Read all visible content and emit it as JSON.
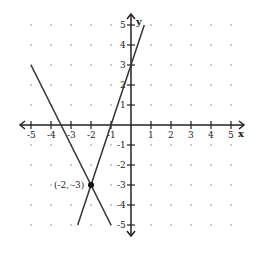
{
  "chart_data": {
    "type": "line",
    "title": "",
    "xlabel": "x",
    "ylabel": "y",
    "xlim": [
      -5,
      5
    ],
    "ylim": [
      -5,
      5
    ],
    "grid": "dotted points at integer coordinates",
    "x_ticks": [
      "-5",
      "-4",
      "-3",
      "-2",
      "-1",
      "1",
      "2",
      "3",
      "4",
      "5"
    ],
    "y_ticks": [
      "5",
      "4",
      "3",
      "2",
      "1",
      "-1",
      "-2",
      "-3",
      "-4",
      "-5"
    ],
    "series": [
      {
        "name": "line-1",
        "equation": "y = 3x + 3",
        "points": [
          [
            -2.667,
            -5
          ],
          [
            0.667,
            5
          ]
        ]
      },
      {
        "name": "line-2",
        "equation": "y = -2x - 7",
        "points": [
          [
            -5,
            3
          ],
          [
            -1,
            -5
          ]
        ]
      }
    ],
    "annotations": [
      {
        "label": "(-2, -3)",
        "point": [
          -2,
          -3
        ],
        "marker": "filled-dot"
      }
    ]
  },
  "labels": {
    "x_axis": "x",
    "y_axis": "y",
    "point": "(-2, -3)",
    "xt": {
      "m5": "-5",
      "m4": "-4",
      "m3": "-3",
      "m2": "-2",
      "m1": "-1",
      "p1": "1",
      "p2": "2",
      "p3": "3",
      "p4": "4",
      "p5": "5"
    },
    "yt": {
      "p5": "5",
      "p4": "4",
      "p3": "3",
      "p2": "2",
      "p1": "1",
      "m1": "-1",
      "m2": "-2",
      "m3": "-3",
      "m4": "-4",
      "m5": "-5"
    }
  }
}
